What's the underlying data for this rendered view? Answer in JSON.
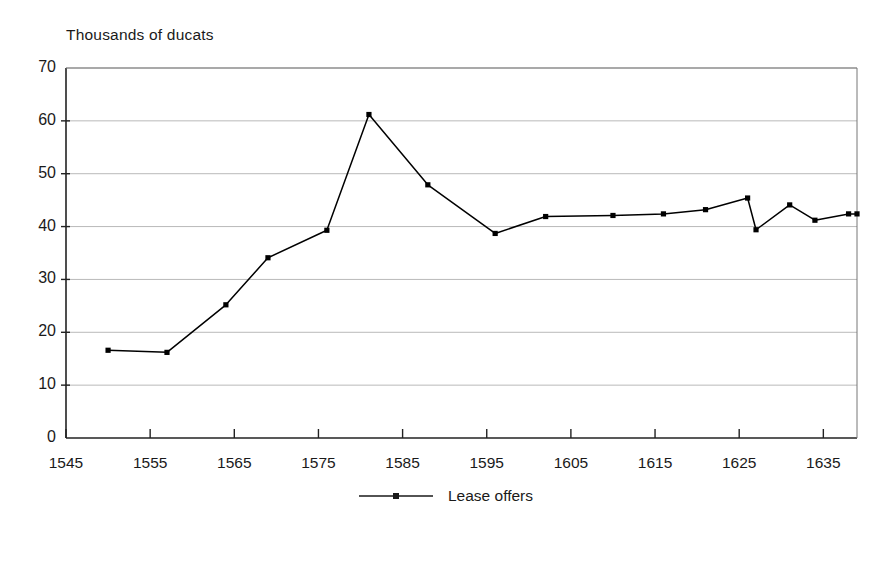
{
  "chart_data": {
    "type": "line",
    "title": "",
    "ylabel": "Thousands of ducats",
    "xlabel": "",
    "ylim": [
      0,
      70
    ],
    "xlim": [
      1545,
      1639
    ],
    "yticks": [
      0,
      10,
      20,
      30,
      40,
      50,
      60,
      70
    ],
    "xticks": [
      1545,
      1555,
      1565,
      1575,
      1585,
      1595,
      1605,
      1615,
      1625,
      1635
    ],
    "grid": "horizontal",
    "legend_position": "bottom-center",
    "series": [
      {
        "name": "Lease offers",
        "marker": "square",
        "color": "#000000",
        "points": [
          {
            "x": 1550,
            "y": 16.6
          },
          {
            "x": 1557,
            "y": 16.2
          },
          {
            "x": 1564,
            "y": 25.2
          },
          {
            "x": 1569,
            "y": 34.1
          },
          {
            "x": 1576,
            "y": 39.3
          },
          {
            "x": 1581,
            "y": 61.2
          },
          {
            "x": 1588,
            "y": 47.9
          },
          {
            "x": 1596,
            "y": 38.7
          },
          {
            "x": 1602,
            "y": 41.9
          },
          {
            "x": 1610,
            "y": 42.1
          },
          {
            "x": 1616,
            "y": 42.4
          },
          {
            "x": 1621,
            "y": 43.2
          },
          {
            "x": 1626,
            "y": 45.4
          },
          {
            "x": 1627,
            "y": 39.4
          },
          {
            "x": 1631,
            "y": 44.1
          },
          {
            "x": 1634,
            "y": 41.2
          },
          {
            "x": 1638,
            "y": 42.4
          },
          {
            "x": 1639,
            "y": 42.4
          }
        ]
      }
    ]
  },
  "legend": {
    "entries": [
      {
        "label": "Lease offers"
      }
    ]
  }
}
